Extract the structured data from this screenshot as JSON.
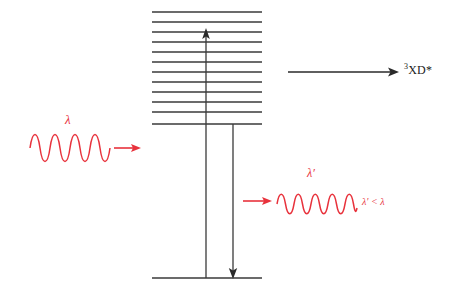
{
  "figure": {
    "background_color": "#ffffff",
    "line_color": "#3a3a3a",
    "wave_color": "#e8323c",
    "width": 449,
    "height": 301
  },
  "labels": {
    "excited_product": "XD*",
    "excited_product_superscript": "3",
    "incident_wavelength": "λ",
    "emitted_wavelength": "λ′",
    "wavelength_inequality": "λ′ < λ"
  },
  "energy_levels": {
    "count": 12,
    "x_start": 152,
    "x_end": 262,
    "y_values": [
      12,
      22,
      32,
      42,
      52,
      62,
      72,
      82,
      92,
      102,
      112,
      124
    ]
  },
  "ground_state": {
    "x_start": 152,
    "x_end": 262,
    "y": 278
  },
  "transitions": [
    {
      "name": "absorption-up-arrow",
      "direction": "up",
      "x": 206,
      "y_start": 278,
      "y_end": 30
    },
    {
      "name": "emission-down-arrow",
      "direction": "down",
      "x": 233,
      "y_start": 124,
      "y_end": 277
    },
    {
      "name": "product-formation-arrow",
      "direction": "right",
      "x_start": 288,
      "x_end": 398,
      "y": 72
    }
  ],
  "waves": [
    {
      "name": "incident-photon-wave",
      "cycles": 4,
      "x_start": 30,
      "x_end": 110,
      "center_y": 148,
      "amplitude": 18,
      "arrow": {
        "x_start": 114,
        "x_end": 140,
        "y": 148
      }
    },
    {
      "name": "emitted-photon-wave",
      "cycles": 4.5,
      "x_start": 277,
      "x_end": 357,
      "center_y": 204,
      "amplitude": 13,
      "arrow": {
        "x_start": 243,
        "x_end": 272,
        "y": 201
      }
    }
  ]
}
